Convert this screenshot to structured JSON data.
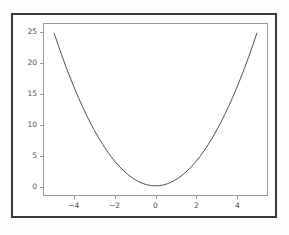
{
  "figure": {
    "background_color": "#ffffff",
    "frame_color": "#3a3a3a",
    "axes_spine_color": "#9a9a9a",
    "tick_label_color": "#4d4d4d"
  },
  "chart_data": {
    "type": "line",
    "title": "",
    "subtitle": "",
    "xlabel": "",
    "ylabel": "",
    "xlim": [
      -5.5,
      5.5
    ],
    "ylim": [
      -1.5,
      26.5
    ],
    "grid": false,
    "legend": null,
    "legend_position": "none",
    "annotations": [],
    "xticks": [
      -4,
      -2,
      0,
      2,
      4
    ],
    "xticklabels": [
      "−4",
      "−2",
      "0",
      "2",
      "4"
    ],
    "yticks": [
      0,
      5,
      10,
      15,
      20,
      25
    ],
    "yticklabels": [
      "0",
      "5",
      "10",
      "15",
      "20",
      "25"
    ],
    "series": [
      {
        "name": "y = x^2",
        "color": "#4f4f4f",
        "linewidth": 1.0,
        "linestyle": "solid",
        "marker": "none",
        "x": [
          -5.0,
          -4.8,
          -4.6,
          -4.4,
          -4.2,
          -4.0,
          -3.8,
          -3.6,
          -3.4,
          -3.2,
          -3.0,
          -2.8,
          -2.6,
          -2.4,
          -2.2,
          -2.0,
          -1.8,
          -1.6,
          -1.4,
          -1.2,
          -1.0,
          -0.8,
          -0.6,
          -0.4,
          -0.2,
          0.0,
          0.2,
          0.4,
          0.6,
          0.8,
          1.0,
          1.2,
          1.4,
          1.6,
          1.8,
          2.0,
          2.2,
          2.4,
          2.6,
          2.8,
          3.0,
          3.2,
          3.4,
          3.6,
          3.8,
          4.0,
          4.2,
          4.4,
          4.6,
          4.8,
          5.0
        ],
        "y": [
          25.0,
          23.04,
          21.16,
          19.36,
          17.64,
          16.0,
          14.44,
          12.96,
          11.56,
          10.24,
          9.0,
          7.84,
          6.76,
          5.76,
          4.84,
          4.0,
          3.24,
          2.56,
          1.96,
          1.44,
          1.0,
          0.64,
          0.36,
          0.16,
          0.04,
          0.0,
          0.04,
          0.16,
          0.36,
          0.64,
          1.0,
          1.44,
          1.96,
          2.56,
          3.24,
          4.0,
          4.84,
          5.76,
          6.76,
          7.84,
          9.0,
          10.24,
          11.56,
          12.96,
          14.44,
          16.0,
          17.64,
          19.36,
          21.16,
          23.04,
          25.0
        ]
      }
    ]
  }
}
